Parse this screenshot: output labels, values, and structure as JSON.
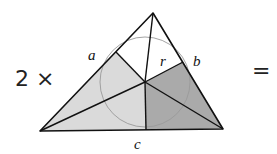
{
  "multiplier": {
    "text": "2 ×"
  },
  "equals": {
    "text": "="
  },
  "labels": {
    "a": "a",
    "b": "b",
    "c": "c",
    "r": "r"
  },
  "colors": {
    "stroke": "#111111",
    "light_fill": "#dadada",
    "dark_fill": "#aaaaaa",
    "circle": "#9a9a9a",
    "background": "#ffffff"
  },
  "geometry": {
    "vertices": {
      "top": [
        153,
        13
      ],
      "bottom_left": [
        40,
        131
      ],
      "bottom_right": [
        223,
        129
      ]
    },
    "incenter": [
      145,
      82
    ],
    "tangent_points": {
      "left": [
        116,
        52
      ],
      "right": [
        183,
        62
      ],
      "bottom": [
        146,
        130
      ]
    },
    "incircle_radius": 45
  }
}
